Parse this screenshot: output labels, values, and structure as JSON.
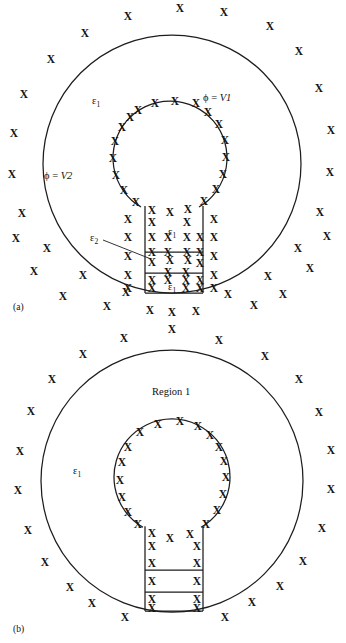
{
  "figure": {
    "background_color": "#ffffff",
    "line_color": "#1d1d1d",
    "mark_color": "#141414",
    "mark_glyph": "X",
    "mark_semantic": "cross-mark-x"
  },
  "panels": [
    {
      "id": "panel-a",
      "caption": "(a)",
      "caption_pos": {
        "x": 13,
        "y": 307
      },
      "outer_circle": {
        "cx": 172,
        "cy": 164,
        "r": 129
      },
      "inner_circle": {
        "cx": 170,
        "cy": 158,
        "r": 57
      },
      "stem": {
        "left": 145,
        "right": 203,
        "top": 214,
        "bottom": 293,
        "dividers": [
          252,
          273
        ]
      },
      "labels": [
        {
          "name": "permittivity-outer-region",
          "text": "ε",
          "sub": "1",
          "x": 92,
          "y": 100
        },
        {
          "name": "potential-inner-conductor",
          "text": "ϕ = ",
          "var": "V1",
          "x": 203,
          "y": 97
        },
        {
          "name": "potential-outer-conductor",
          "text": "ϕ = ",
          "var": "V2",
          "x": 44,
          "y": 175
        },
        {
          "name": "permittivity-stem-upper",
          "text": "ε",
          "sub": "1",
          "x": 168,
          "y": 231
        },
        {
          "name": "permittivity-stem-middle",
          "text": "ε",
          "sub": "2",
          "x": 90,
          "y": 237
        },
        {
          "name": "permittivity-stem-lower",
          "text": "ε",
          "sub": "1",
          "x": 168,
          "y": 286
        }
      ],
      "leader_line": {
        "x1": 103,
        "y1": 240,
        "x2": 151,
        "y2": 259
      },
      "marks_description": "crosses fill both annular and stem regions as well as ring the conductor boundaries"
    },
    {
      "id": "panel-b",
      "caption": "(b)",
      "caption_pos": {
        "x": 13,
        "y": 629
      },
      "outer_circle": {
        "cx": 172,
        "cy": 481,
        "r": 131
      },
      "inner_circle": {
        "cx": 172,
        "cy": 477,
        "r": 58
      },
      "stem": {
        "left": 145,
        "right": 203,
        "top": 534,
        "bottom": 611,
        "dividers": [
          570,
          592
        ]
      },
      "labels": [
        {
          "name": "region-one-label",
          "text": "Region 1",
          "x": 152,
          "y": 391
        },
        {
          "name": "permittivity-outer-region",
          "text": "ε",
          "sub": "1",
          "x": 73,
          "y": 470
        }
      ],
      "marks_description": "crosses ring the outer circle exterior, the inner circle interior boundary and line the stem walls only"
    }
  ],
  "marks": {
    "panel_a_outer_exterior": [
      [
        180,
        8
      ],
      [
        224,
        12
      ],
      [
        128,
        16
      ],
      [
        85,
        33
      ],
      [
        270,
        26
      ],
      [
        51,
        59
      ],
      [
        299,
        51
      ],
      [
        24,
        94
      ],
      [
        319,
        88
      ],
      [
        14,
        133
      ],
      [
        331,
        130
      ],
      [
        12,
        174
      ],
      [
        330,
        172
      ],
      [
        22,
        213
      ],
      [
        320,
        212
      ],
      [
        47,
        248
      ],
      [
        298,
        248
      ],
      [
        83,
        275
      ],
      [
        268,
        276
      ],
      [
        126,
        292
      ],
      [
        228,
        294
      ],
      [
        150,
        310
      ],
      [
        172,
        312
      ],
      [
        196,
        311
      ],
      [
        107,
        306
      ],
      [
        254,
        305
      ],
      [
        63,
        296
      ],
      [
        283,
        294
      ],
      [
        34,
        271
      ],
      [
        310,
        268
      ],
      [
        16,
        238
      ],
      [
        327,
        236
      ]
    ],
    "panel_a_inner_ring": [
      [
        138,
        110
      ],
      [
        155,
        103
      ],
      [
        175,
        101
      ],
      [
        196,
        103
      ],
      [
        208,
        112
      ],
      [
        219,
        124
      ],
      [
        225,
        140
      ],
      [
        226,
        157
      ],
      [
        223,
        174
      ],
      [
        216,
        189
      ],
      [
        204,
        201
      ],
      [
        188,
        209
      ],
      [
        170,
        212
      ],
      [
        152,
        210
      ],
      [
        136,
        202
      ],
      [
        124,
        190
      ],
      [
        116,
        175
      ],
      [
        113,
        158
      ],
      [
        115,
        141
      ],
      [
        122,
        127
      ],
      [
        130,
        117
      ]
    ],
    "panel_a_annulus_fill": [
      [
        128,
        219
      ],
      [
        128,
        237
      ],
      [
        128,
        256
      ],
      [
        128,
        275
      ],
      [
        128,
        288
      ],
      [
        214,
        219
      ],
      [
        214,
        237
      ],
      [
        214,
        256
      ],
      [
        214,
        275
      ],
      [
        214,
        288
      ]
    ],
    "panel_a_stem_fill": [
      [
        152,
        222
      ],
      [
        187,
        222
      ],
      [
        152,
        237
      ],
      [
        168,
        237
      ],
      [
        187,
        237
      ],
      [
        200,
        237
      ],
      [
        152,
        252
      ],
      [
        168,
        252
      ],
      [
        187,
        252
      ],
      [
        200,
        252
      ],
      [
        152,
        262
      ],
      [
        170,
        260
      ],
      [
        188,
        260
      ],
      [
        200,
        263
      ],
      [
        168,
        272
      ],
      [
        186,
        272
      ],
      [
        152,
        280
      ],
      [
        168,
        280
      ],
      [
        186,
        280
      ],
      [
        200,
        280
      ],
      [
        152,
        288
      ],
      [
        186,
        288
      ],
      [
        200,
        288
      ]
    ],
    "panel_b_outer_exterior": [
      [
        172,
        329
      ],
      [
        124,
        338
      ],
      [
        219,
        340
      ],
      [
        83,
        354
      ],
      [
        265,
        356
      ],
      [
        52,
        379
      ],
      [
        299,
        379
      ],
      [
        31,
        411
      ],
      [
        319,
        412
      ],
      [
        20,
        451
      ],
      [
        331,
        450
      ],
      [
        18,
        490
      ],
      [
        331,
        489
      ],
      [
        28,
        530
      ],
      [
        322,
        528
      ],
      [
        45,
        562
      ],
      [
        303,
        561
      ],
      [
        70,
        587
      ],
      [
        280,
        586
      ],
      [
        92,
        603
      ],
      [
        252,
        602
      ],
      [
        125,
        617
      ],
      [
        225,
        617
      ]
    ],
    "panel_b_inner_ring": [
      [
        140,
        432
      ],
      [
        158,
        424
      ],
      [
        180,
        421
      ],
      [
        198,
        426
      ],
      [
        210,
        435
      ],
      [
        219,
        447
      ],
      [
        224,
        461
      ],
      [
        226,
        477
      ],
      [
        223,
        494
      ],
      [
        217,
        510
      ],
      [
        206,
        524
      ],
      [
        190,
        534
      ],
      [
        170,
        538
      ],
      [
        152,
        533
      ],
      [
        138,
        524
      ],
      [
        128,
        512
      ],
      [
        122,
        497
      ],
      [
        120,
        480
      ],
      [
        122,
        462
      ],
      [
        128,
        447
      ]
    ],
    "panel_b_stem_walls": [
      [
        152,
        546
      ],
      [
        197,
        546
      ],
      [
        152,
        563
      ],
      [
        197,
        563
      ],
      [
        152,
        581
      ],
      [
        197,
        581
      ],
      [
        152,
        599
      ],
      [
        197,
        599
      ],
      [
        152,
        608
      ],
      [
        197,
        608
      ]
    ]
  }
}
